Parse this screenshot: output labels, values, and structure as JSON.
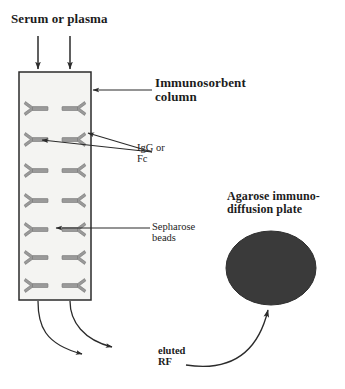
{
  "figure": {
    "background_color": "#ffffff",
    "line_color": "#2b2b2b",
    "column_fill": "#f4f4f2",
    "molecule_fill": "#9a9a9a",
    "molecule_stroke": "#6f6f6f",
    "plate_fill": "#3a3a3a"
  },
  "labels": {
    "serum": "Serum or plasma",
    "column_line1": "Immunosorbent",
    "column_line2": "column",
    "igg_line1": "IgG or",
    "igg_line2": "Fc",
    "sepharose_line1": "Sepharose",
    "sepharose_line2": "beads",
    "plate_line1": "Agarose immuno-",
    "plate_line2": "diffusion plate",
    "eluted_line1": "eluted",
    "eluted_line2": "RF"
  },
  "column": {
    "x": 19,
    "y": 72,
    "width": 72,
    "height": 228,
    "rows": 7,
    "columns_per_row": 2,
    "molecule_count": 14,
    "molecule_name": "igg-antibody-y-shape"
  },
  "plate": {
    "center_x": 271,
    "center_y": 268,
    "radius_x": 45,
    "radius_y": 37,
    "shape": "ellipse"
  },
  "arrows": {
    "inlet_count": 2,
    "inlet_labels": [
      "serum-inlet-arrow-left",
      "serum-inlet-arrow-right"
    ],
    "outlet_count": 2,
    "outlet_labels": [
      "eluate-outlet-curve-left",
      "eluate-outlet-curve-right"
    ],
    "transfer": "rf-transfer-arrow-to-plate",
    "leaders": [
      "column-leader",
      "igg-leader-left",
      "igg-leader-right",
      "sepharose-leader"
    ]
  }
}
